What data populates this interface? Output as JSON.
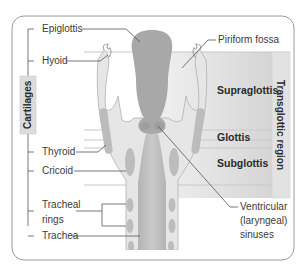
{
  "diagram": {
    "type": "anatomical-diagram",
    "labels_left": {
      "group_label": "Cartilages",
      "items": [
        {
          "label": "Epiglottis"
        },
        {
          "label": "Hyoid"
        },
        {
          "label": "Thyroid"
        },
        {
          "label": "Cricoid"
        },
        {
          "label_line1": "Tracheal",
          "label_line2": "rings"
        },
        {
          "label": "Trachea"
        }
      ]
    },
    "labels_right": {
      "piriform": "Piriform fossa",
      "regions": [
        {
          "label": "Supraglottis"
        },
        {
          "label": "Glottis"
        },
        {
          "label": "Subglottis"
        }
      ],
      "group_label": "Transglottic region",
      "ventricular_line1": "Ventricular",
      "ventricular_line2": "(laryngeal)",
      "ventricular_line3": "sinuses"
    },
    "colors": {
      "frame": "#9a9a9a",
      "tissue_light": "#e4e4e4",
      "tissue_dark": "#a9a9a9",
      "cartilage": "#b7b7b7",
      "region_panel": "#d8d8d8",
      "group_bar": "#dcdcdc",
      "leader": "#555555"
    }
  }
}
